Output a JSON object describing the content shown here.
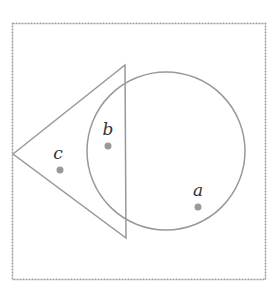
{
  "diagram": {
    "type": "venn",
    "universe": {
      "x": 12,
      "y": 23,
      "width": 253,
      "height": 256,
      "stroke": "#999999",
      "style": "dashed"
    },
    "shapes": [
      {
        "id": "triangle",
        "points": "13,154 125,65 126,238",
        "stroke": "#999999"
      },
      {
        "id": "circle",
        "cx": 166,
        "cy": 151,
        "r": 79,
        "stroke": "#999999"
      }
    ],
    "points": [
      {
        "id": "a",
        "label": "a",
        "x": 198,
        "y": 207,
        "label_x": 198,
        "label_y": 196,
        "region": "circle only"
      },
      {
        "id": "b",
        "label": "b",
        "x": 108,
        "y": 146,
        "label_x": 108,
        "label_y": 135,
        "region": "triangle and circle"
      },
      {
        "id": "c",
        "label": "c",
        "x": 60,
        "y": 170,
        "label_x": 58,
        "label_y": 159,
        "region": "triangle only"
      }
    ],
    "point_color": "#999999"
  }
}
